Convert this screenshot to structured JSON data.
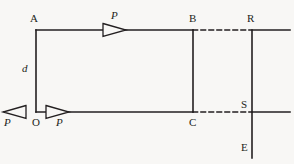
{
  "figure": {
    "type": "physics-force-diagram",
    "background_color": "#f8f7f5",
    "stroke_color": "#231f20",
    "labels": {
      "vertex_a": "A",
      "vertex_b": "B",
      "vertex_c": "C",
      "vertex_o": "O",
      "vertex_r": "R",
      "vertex_s": "S",
      "vertex_e": "E",
      "distance_d": "d",
      "force_top": "P",
      "force_bottom_left": "P",
      "force_bottom_right": "P"
    },
    "geometry": {
      "rect_left_x": 36,
      "rect_right_x": 193,
      "rect_top_y": 30,
      "rect_bottom_y": 112,
      "bar_x": 252,
      "bar_top_y": 31,
      "bar_bottom_y": 158,
      "right_edge_x": 290
    },
    "arrows": [
      {
        "name": "top-arrow",
        "direction": "right",
        "tip_x": 126,
        "tail_x": 103,
        "y": 30
      },
      {
        "name": "bottom-left-arrow",
        "direction": "left",
        "tip_x": 3,
        "tail_x": 26,
        "y": 112
      },
      {
        "name": "bottom-right-arrow",
        "direction": "right",
        "tip_x": 69,
        "tail_x": 46,
        "y": 112
      }
    ],
    "segments": [
      {
        "name": "segment-a-b",
        "style": "solid"
      },
      {
        "name": "segment-a-o",
        "style": "solid"
      },
      {
        "name": "segment-o-c",
        "style": "solid"
      },
      {
        "name": "segment-b-c",
        "style": "solid"
      },
      {
        "name": "segment-b-r",
        "style": "dashed"
      },
      {
        "name": "segment-c-s",
        "style": "dashed"
      },
      {
        "name": "segment-r-right",
        "style": "solid"
      },
      {
        "name": "segment-s-right",
        "style": "solid"
      },
      {
        "name": "segment-r-e-vertical",
        "style": "solid"
      }
    ]
  }
}
